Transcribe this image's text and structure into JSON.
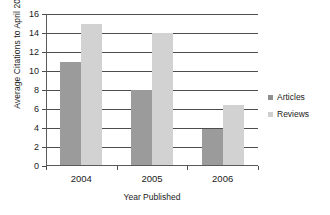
{
  "chart_data": {
    "type": "bar",
    "title": "",
    "subtitle": "",
    "xlabel": "Year Published",
    "ylabel": "Average Citations to April 2008",
    "categories": [
      "2004",
      "2005",
      "2006"
    ],
    "series": [
      {
        "name": "Articles",
        "color": "#9b9b9b",
        "values": [
          11,
          8,
          3.9
        ]
      },
      {
        "name": "Reviews",
        "color": "#d2d2d2",
        "values": [
          15,
          14,
          6.4
        ]
      }
    ],
    "ylim": [
      0,
      16
    ],
    "ytick_step": 2,
    "yticks": [
      0,
      2,
      4,
      6,
      8,
      10,
      12,
      14,
      16
    ],
    "ytick_labels": [
      "0",
      "2",
      "4",
      "6",
      "8",
      "10",
      "12",
      "14",
      "16"
    ],
    "grid": "horizontal",
    "grid_color": "#4d4d4d",
    "legend_position": "right",
    "legend_entries": [
      "Articles",
      "Reviews"
    ],
    "axis_color": "#5a5a5a",
    "background": "#ffffff"
  }
}
